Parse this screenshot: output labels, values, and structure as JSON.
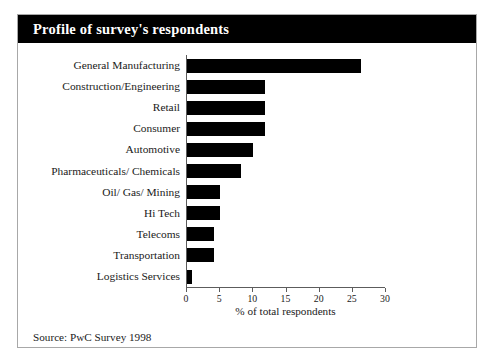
{
  "figure": {
    "title": "Profile of survey's respondents",
    "source": "Source: PwC Survey 1998"
  },
  "colors": {
    "title_bar_bg": "#000000",
    "title_text": "#ffffff",
    "bar": "#000000",
    "axis": "#5c5c5c",
    "frame": "#a8a8a8",
    "text": "#1a1a1a"
  },
  "chart_data": {
    "type": "bar",
    "orientation": "horizontal",
    "title": "Profile of survey's respondents",
    "xlabel": "% of total respondents",
    "ylabel": "",
    "xlim": [
      0,
      30
    ],
    "xticks": [
      0,
      5,
      10,
      15,
      20,
      25,
      30
    ],
    "xtick_labels": [
      "0",
      "5",
      "10",
      "15",
      "20",
      "25",
      "30"
    ],
    "grid": false,
    "legend": null,
    "categories": [
      "General Manufacturing",
      "Construction/Engineering",
      "Retail",
      "Consumer",
      "Automotive",
      "Pharmaceuticals/ Chemicals",
      "Oil/ Gas/ Mining",
      "Hi Tech",
      "Telecoms",
      "Transportation",
      "Logistics Services"
    ],
    "values": [
      26.3,
      11.7,
      11.7,
      11.8,
      9.9,
      8.1,
      5.0,
      5.0,
      4.0,
      4.0,
      0.8
    ],
    "source": "Source: PwC Survey 1998"
  }
}
